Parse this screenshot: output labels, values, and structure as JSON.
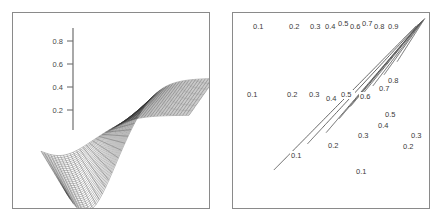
{
  "figure": {
    "panels": [
      {
        "name": "surface-plot",
        "type": "3d-surface-mesh",
        "axis": {
          "orientation": "vertical",
          "tick_labels": [
            "0.8",
            "0.6",
            "0.4",
            "0.2"
          ],
          "tick_values": [
            0.8,
            0.6,
            0.4,
            0.2
          ],
          "range": [
            0,
            1
          ]
        }
      },
      {
        "name": "contour-plot",
        "type": "contour",
        "levels": [
          0.1,
          0.2,
          0.3,
          0.4,
          0.5,
          0.6,
          0.7,
          0.8,
          0.9
        ]
      }
    ]
  },
  "chart_data": [
    {
      "type": "line",
      "name": "surface-mesh-wireframe",
      "title": "",
      "xlabel": "",
      "ylabel": "",
      "ylim": [
        0,
        1
      ],
      "axis_ticks": [
        0.2,
        0.4,
        0.6,
        0.8
      ],
      "axis_tick_labels": [
        "0.2",
        "0.4",
        "0.6",
        "0.8"
      ],
      "description": "Three-dimensional mesh (wireframe) surface with a saddle-like shape: a deep downward-curving sheet on the left front and a raised plateau rising to about 0.3 on the right, joined by a twisted ridge through the centre.",
      "grid": false,
      "legend": null
    },
    {
      "type": "heatmap",
      "name": "contour-levels",
      "title": "",
      "xlabel": "",
      "ylabel": "",
      "grid": false,
      "legend": null,
      "levels": [
        0.1,
        0.2,
        0.3,
        0.4,
        0.5,
        0.6,
        0.7,
        0.8,
        0.9
      ],
      "top_labels": [
        "0.1",
        "0.2",
        "0.3",
        "0.4",
        "0.5",
        "0.6",
        "0.7",
        "0.8",
        "0.9"
      ],
      "inline_labels_upper": [
        "0.1",
        "0.2",
        "0.3",
        "0.4",
        "0.5",
        "0.6",
        "0.7",
        "0.8"
      ],
      "inline_labels_lower": [
        "0.1",
        "0.2",
        "0.3",
        "0.4",
        "0.5"
      ],
      "right_edge_labels": [
        "0.2",
        "0.3"
      ],
      "description": "Nested hyperbola-like contour curves increasing from 0.1 at the lower-left to 0.9 at the upper-right; each contour is labelled where it enters the top edge and again along its curve."
    }
  ],
  "contours": {
    "top_labels": [
      {
        "text": "0.1",
        "x": 20,
        "y": 16
      },
      {
        "text": "0.2",
        "x": 56,
        "y": 16
      },
      {
        "text": "0.3",
        "x": 77,
        "y": 16
      },
      {
        "text": "0.4",
        "x": 92,
        "y": 16
      },
      {
        "text": "0.5",
        "x": 105,
        "y": 13
      },
      {
        "text": "0.6",
        "x": 117,
        "y": 16
      },
      {
        "text": "0.7",
        "x": 129,
        "y": 13
      },
      {
        "text": "0.8",
        "x": 141,
        "y": 16
      },
      {
        "text": "0.9",
        "x": 155,
        "y": 16
      }
    ],
    "inline_labels": [
      {
        "text": "0.1",
        "x": 14,
        "y": 84
      },
      {
        "text": "0.2",
        "x": 54,
        "y": 84
      },
      {
        "text": "0.3",
        "x": 76,
        "y": 84
      },
      {
        "text": "0.4",
        "x": 93,
        "y": 88
      },
      {
        "text": "0.5",
        "x": 108,
        "y": 84
      },
      {
        "text": "0.6",
        "x": 127,
        "y": 86
      },
      {
        "text": "0.7",
        "x": 146,
        "y": 78
      },
      {
        "text": "0.8",
        "x": 155,
        "y": 70
      },
      {
        "text": "0.5",
        "x": 152,
        "y": 104
      },
      {
        "text": "0.4",
        "x": 145,
        "y": 115
      },
      {
        "text": "0.3",
        "x": 125,
        "y": 125
      },
      {
        "text": "0.2",
        "x": 95,
        "y": 135
      },
      {
        "text": "0.1",
        "x": 58,
        "y": 145
      },
      {
        "text": "0.3",
        "x": 178,
        "y": 125
      },
      {
        "text": "0.2",
        "x": 170,
        "y": 136
      },
      {
        "text": "0.1",
        "x": 123,
        "y": 161
      }
    ]
  },
  "surface": {
    "tick_labels": [
      {
        "text": "0.8",
        "value": 0.8
      },
      {
        "text": "0.6",
        "value": 0.6
      },
      {
        "text": "0.4",
        "value": 0.4
      },
      {
        "text": "0.2",
        "value": 0.2
      }
    ]
  },
  "colors": {
    "frame": "#8a8a8a",
    "contour_stroke": "#555555",
    "mesh_stroke": "#3c3c3c",
    "axis": "#6f6f6f",
    "label_text": "#3a3a3a",
    "background": "#ffffff"
  }
}
